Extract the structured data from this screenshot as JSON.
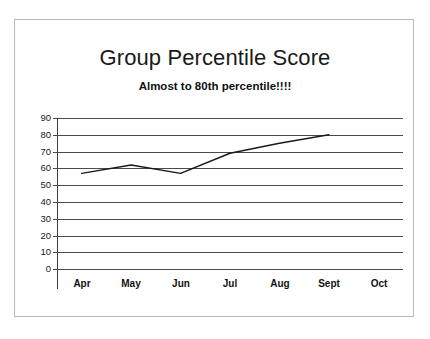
{
  "chart": {
    "title": "Group Percentile Score",
    "subtitle": "Almost to 80th percentile!!!!"
  },
  "chart_data": {
    "type": "line",
    "title": "Group Percentile Score",
    "subtitle": "Almost to 80th percentile!!!!",
    "xlabel": "",
    "ylabel": "",
    "categories": [
      "Apr",
      "May",
      "Jun",
      "Jul",
      "Aug",
      "Sept",
      "Oct"
    ],
    "values": [
      57,
      62,
      57,
      69,
      75,
      80,
      null
    ],
    "series": [
      {
        "name": "Group Percentile Score",
        "values": [
          57,
          62,
          57,
          69,
          75,
          80,
          null
        ]
      }
    ],
    "ylim": [
      0,
      90
    ],
    "ytick_step": 10,
    "yticks": [
      90,
      80,
      70,
      60,
      50,
      40,
      30,
      20,
      10,
      0
    ],
    "ytick_labels": [
      "90",
      "80",
      "70",
      "60",
      "50",
      "40",
      "30",
      "20",
      "10",
      "0"
    ],
    "grid": true,
    "grid_axis": "y",
    "legend": false,
    "legend_position": "none",
    "line_color": "#1a1a1a",
    "grid_color": "#4a4a4a",
    "background_color": "#ffffff",
    "markers": false
  }
}
